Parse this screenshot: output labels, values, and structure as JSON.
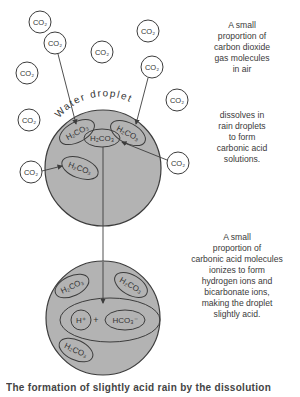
{
  "diagram": {
    "droplet_label": "Water droplet",
    "molecules": {
      "co2": "CO₂",
      "h2co3": "H₂CO₃",
      "h_ion": "H⁺",
      "plus": "+",
      "hco3_ion": "HCO₃⁻"
    },
    "colors": {
      "droplet_fill": "#b3b3b3",
      "stroke": "#3c3c3c",
      "background": "#ffffff"
    }
  },
  "annotations": {
    "air": [
      "A small",
      "proportion of",
      "carbon dioxide",
      "gas molecules",
      "in air"
    ],
    "dissolve": [
      "dissolves in",
      "rain droplets",
      "to form",
      "carbonic acid",
      "solutions."
    ],
    "ionize": [
      "A small",
      "proportion of",
      "carbonic acid molecules",
      "ionizes to form",
      "hydrogen ions and",
      "bicarbonate ions,",
      "making the droplet",
      "slightly acid."
    ]
  },
  "caption": "The formation of slightly acid rain by the dissolution"
}
